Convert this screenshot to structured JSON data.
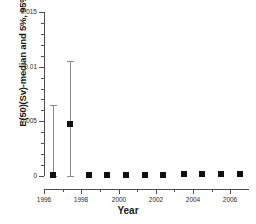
{
  "chart_data": {
    "type": "scatter",
    "title": "",
    "xlabel": "Year",
    "ylabel": "E(50)(Sv)-median and 5%, 95% limits",
    "xlim": [
      1996.0,
      2007.0
    ],
    "ylim": [
      0,
      0.015
    ],
    "grid": false,
    "legend": null,
    "xticks": [
      1996,
      1998,
      2000,
      2002,
      2004,
      2006
    ],
    "xtick_labels": [
      "1996",
      "1998",
      "2000",
      "2002",
      "2004",
      "2006"
    ],
    "x_minor_ticks": [
      1997,
      1999,
      2001,
      2003,
      2005
    ],
    "yticks": [
      0,
      0.005,
      0.01,
      0.015
    ],
    "ytick_labels": [
      "0",
      "0.005",
      "0.01",
      "0.015"
    ],
    "y_minor_tick_count_per_major": 5,
    "marker_style": "filled-square",
    "marker_color": "#111111",
    "errorbar_color": "#8a8a8a",
    "x": [
      1996.5,
      1997.4,
      1998.4,
      1999.4,
      2000.4,
      2001.4,
      2002.4,
      2003.5,
      2004.5,
      2005.5,
      2006.5
    ],
    "y": [
      5e-05,
      0.00475,
      8e-05,
      0.0001,
      0.0001,
      0.00012,
      0.00012,
      0.00014,
      0.00016,
      0.00018,
      0.00018
    ],
    "yerr_low": [
      5e-05,
      0.00475,
      0,
      0,
      0,
      0,
      0,
      0,
      0,
      0,
      0
    ],
    "yerr_high": [
      0.00645,
      0.00575,
      0,
      0,
      0,
      0,
      0,
      0,
      0,
      0,
      0
    ],
    "series": [
      {
        "name": "E(50)(Sv) median with 5%/95% limits",
        "points": [
          {
            "year": 1996.5,
            "median": 5e-05,
            "low": 0.0,
            "high": 0.0065
          },
          {
            "year": 1997.4,
            "median": 0.00475,
            "low": 0.0,
            "high": 0.0105
          },
          {
            "year": 1998.4,
            "median": 8e-05,
            "low": null,
            "high": null
          },
          {
            "year": 1999.4,
            "median": 0.0001,
            "low": null,
            "high": null
          },
          {
            "year": 2000.4,
            "median": 0.0001,
            "low": null,
            "high": null
          },
          {
            "year": 2001.4,
            "median": 0.00012,
            "low": null,
            "high": null
          },
          {
            "year": 2002.4,
            "median": 0.00012,
            "low": null,
            "high": null
          },
          {
            "year": 2003.5,
            "median": 0.00014,
            "low": null,
            "high": null
          },
          {
            "year": 2004.5,
            "median": 0.00016,
            "low": null,
            "high": null
          },
          {
            "year": 2005.5,
            "median": 0.00018,
            "low": null,
            "high": null
          },
          {
            "year": 2006.5,
            "median": 0.00018,
            "low": null,
            "high": null
          }
        ]
      }
    ]
  }
}
